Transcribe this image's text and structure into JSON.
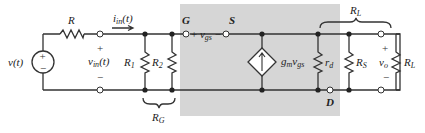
{
  "diagram": {
    "type": "small-signal equivalent circuit",
    "colors": {
      "shade": "#d6d6d6",
      "wire": "#333333",
      "background": "#ffffff"
    },
    "source": {
      "label": "v(t)",
      "plus": "+",
      "minus": "−"
    },
    "series_resistor": {
      "label": "R"
    },
    "input_current": {
      "label_main": "i",
      "label_sub": "in",
      "label_tail": "(t)"
    },
    "input_voltage": {
      "label_main": "v",
      "label_sub": "in",
      "label_tail": "(t)",
      "plus": "+",
      "minus": "−"
    },
    "R1": {
      "label_main": "R",
      "label_sub": "1"
    },
    "R2": {
      "label_main": "R",
      "label_sub": "2"
    },
    "RG": {
      "label_main": "R",
      "label_sub": "G"
    },
    "gate": {
      "label": "G"
    },
    "source_node": {
      "label": "S"
    },
    "drain": {
      "label": "D"
    },
    "vgs": {
      "plus": "+",
      "label_main": "v",
      "label_sub": "gs",
      "minus": "−"
    },
    "dependent_source": {
      "label_main": "g",
      "label_sub1": "m",
      "label_mid": "v",
      "label_sub2": "gs"
    },
    "rd": {
      "label_main": "r",
      "label_sub": "d"
    },
    "RS": {
      "label_main": "R",
      "label_sub": "S"
    },
    "vo": {
      "label_main": "v",
      "label_sub": "o",
      "plus": "+",
      "minus": "−"
    },
    "RL_load": {
      "label_main": "R",
      "label_sub": "L"
    },
    "RL_brace": {
      "label_main": "R",
      "label_sub": "L"
    }
  }
}
